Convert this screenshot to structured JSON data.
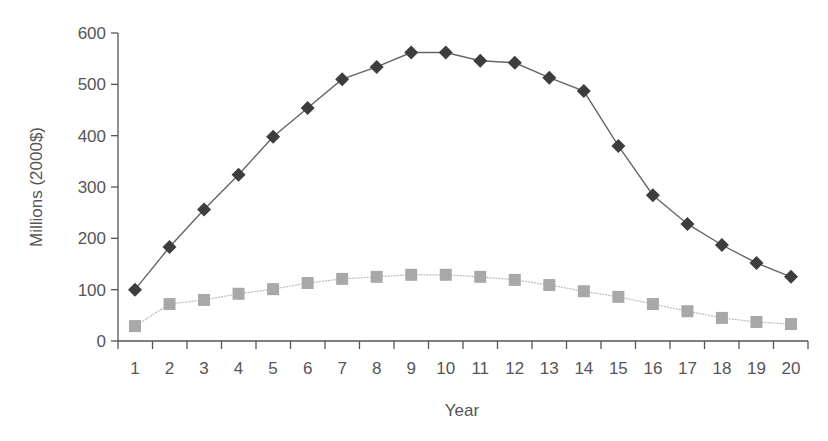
{
  "chart_data": {
    "type": "line",
    "title": "",
    "xlabel": "Year",
    "ylabel": "Millions (2000$)",
    "x": [
      1,
      2,
      3,
      4,
      5,
      6,
      7,
      8,
      9,
      10,
      11,
      12,
      13,
      14,
      15,
      16,
      17,
      18,
      19,
      20
    ],
    "ylim": [
      0,
      600
    ],
    "yticks": [
      0,
      100,
      200,
      300,
      400,
      500,
      600
    ],
    "grid": false,
    "legend": "none",
    "series": [
      {
        "name": "Series 1 (diamond)",
        "marker": "diamond",
        "color": "#3d3d3d",
        "values": [
          100,
          183,
          256,
          324,
          398,
          454,
          510,
          534,
          562,
          562,
          546,
          542,
          513,
          487,
          380,
          284,
          228,
          187,
          152,
          125
        ]
      },
      {
        "name": "Series 2 (square)",
        "marker": "square",
        "color": "#a8a8a8",
        "values": [
          29,
          72,
          80,
          92,
          101,
          113,
          121,
          125,
          129,
          129,
          125,
          119,
          109,
          97,
          86,
          72,
          58,
          45,
          37,
          33
        ]
      }
    ]
  }
}
